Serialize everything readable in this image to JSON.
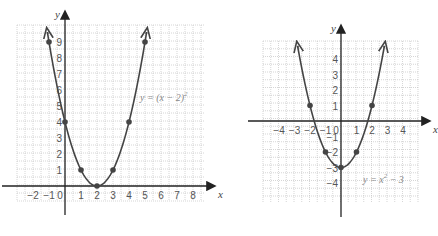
{
  "chart_data": [
    {
      "type": "line",
      "title": "",
      "equation": "y = (x − 2)²",
      "equation_superscript": "2",
      "xlabel": "x",
      "ylabel": "y",
      "x_ticks": [
        -2,
        -1,
        0,
        1,
        2,
        3,
        4,
        5,
        6,
        7,
        8
      ],
      "y_ticks": [
        1,
        2,
        3,
        4,
        5,
        6,
        7,
        8,
        9
      ],
      "grid": true,
      "points": [
        [
          -1,
          9
        ],
        [
          0,
          4
        ],
        [
          1,
          1
        ],
        [
          2,
          0
        ],
        [
          3,
          1
        ],
        [
          4,
          4
        ],
        [
          5,
          9
        ]
      ],
      "xlim": [
        -3,
        9.4
      ],
      "ylim": [
        -1.4,
        10
      ]
    },
    {
      "type": "line",
      "title": "",
      "equation": "y = x² − 3",
      "xlabel": "x",
      "ylabel": "y",
      "x_ticks": [
        -4,
        -3,
        -2,
        -1,
        0,
        1,
        2,
        3,
        4
      ],
      "y_ticks": [
        4,
        3,
        2,
        1,
        -1,
        -2,
        -3,
        -4
      ],
      "grid": true,
      "points": [
        [
          -2,
          1
        ],
        [
          -1,
          -2
        ],
        [
          0,
          -3
        ],
        [
          1,
          -2
        ],
        [
          2,
          1
        ]
      ],
      "xlim": [
        -5,
        5
      ],
      "ylim": [
        -5,
        5
      ]
    }
  ]
}
